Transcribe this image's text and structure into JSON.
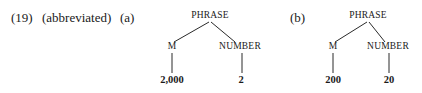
{
  "example": {
    "number": "(19)",
    "note": "(abbreviated)",
    "trees": [
      {
        "label": "(a)",
        "root": "PHRASE",
        "left": {
          "node": "M",
          "leaf": "2,000"
        },
        "right": {
          "node": "NUMBER",
          "leaf": "2"
        }
      },
      {
        "label": "(b)",
        "root": "PHRASE",
        "left": {
          "node": "M",
          "leaf": "200"
        },
        "right": {
          "node": "NUMBER",
          "leaf": "20"
        }
      }
    ]
  }
}
